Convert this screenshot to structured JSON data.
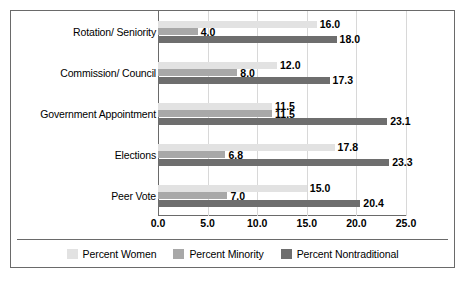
{
  "chart_data": {
    "type": "bar",
    "orientation": "horizontal",
    "title": "",
    "xlabel": "",
    "ylabel": "",
    "xlim": [
      0.0,
      25.0
    ],
    "xticks": [
      "0.0",
      "5.0",
      "10.0",
      "15.0",
      "20.0",
      "25.0"
    ],
    "xtick_values": [
      0.0,
      5.0,
      10.0,
      15.0,
      20.0,
      25.0
    ],
    "grid": true,
    "legend_position": "bottom",
    "categories": [
      "Rotation/ Seniority",
      "Commission/ Council",
      "Government Appointment",
      "Elections",
      "Peer Vote"
    ],
    "series": [
      {
        "name": "Percent Women",
        "color": "#e2e2e2",
        "values": [
          16.0,
          12.0,
          11.5,
          17.8,
          15.0
        ],
        "labels": [
          "16.0",
          "12.0",
          "11.5",
          "17.8",
          "15.0"
        ]
      },
      {
        "name": "Percent Minority",
        "color": "#a8a8a8",
        "values": [
          4.0,
          8.0,
          11.5,
          6.8,
          7.0
        ],
        "labels": [
          "4.0",
          "8.0",
          "11.5",
          "6.8",
          "7.0"
        ]
      },
      {
        "name": "Percent Nontraditional",
        "color": "#6e6e6e",
        "values": [
          18.0,
          17.3,
          23.1,
          23.3,
          20.4
        ],
        "labels": [
          "18.0",
          "17.3",
          "23.1",
          "23.3",
          "20.4"
        ]
      }
    ]
  },
  "colors": {
    "border": "#6a6a6a",
    "grid": "#d8d8d8",
    "background": "#ffffff",
    "text": "#000000"
  }
}
